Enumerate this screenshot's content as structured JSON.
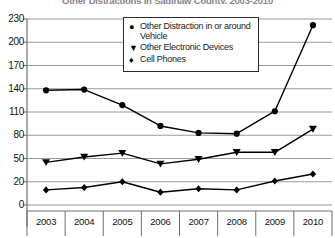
{
  "chart_data": {
    "type": "line",
    "title": "Other Distractions in Saginaw County, 2003-2010",
    "xlabel": "",
    "ylabel": "",
    "categories": [
      "2003",
      "2004",
      "2005",
      "2006",
      "2007",
      "2008",
      "2009",
      "2010"
    ],
    "yticks": [
      0,
      20,
      50,
      80,
      110,
      140,
      170,
      200,
      230
    ],
    "ylim": [
      0,
      230
    ],
    "grid": true,
    "legend_position": "top-center",
    "series": [
      {
        "name": "Other Distraction in or around Vehicle",
        "marker": "circle",
        "values": [
          138,
          139,
          119,
          92,
          83,
          82,
          111,
          222
        ]
      },
      {
        "name": "Other Electronic Devices",
        "marker": "triangle-down",
        "values": [
          45,
          52,
          57,
          43,
          49,
          58,
          58,
          88
        ]
      },
      {
        "name": "Cell Phones",
        "marker": "diamond",
        "values": [
          13,
          15,
          20,
          11,
          14,
          13,
          21,
          30
        ]
      }
    ]
  },
  "legend": {
    "items": [
      {
        "marker_glyph": "●",
        "label": "Other Distraction in or around Vehicle"
      },
      {
        "marker_glyph": "▼",
        "label": "Other Electronic Devices"
      },
      {
        "marker_glyph": "♦",
        "label": "Cell Phones"
      }
    ]
  },
  "colors": {
    "series_line": "#000000",
    "grid": "#9a9a9a",
    "axis": "#6f6f6f",
    "text": "#111111"
  }
}
